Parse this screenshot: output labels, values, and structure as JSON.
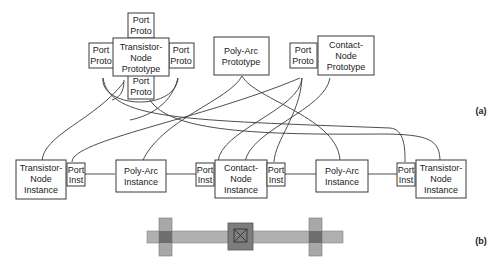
{
  "panel_a": {
    "label": "(a)",
    "prototypes": {
      "transistor": {
        "line1": "Transistor-",
        "line2": "Node",
        "line3": "Prototype"
      },
      "poly_arc": {
        "line1": "Poly-Arc",
        "line2": "Prototype"
      },
      "contact": {
        "line1": "Contact-",
        "line2": "Node",
        "line3": "Prototype"
      },
      "port_proto": {
        "line1": "Port",
        "line2": "Proto"
      }
    },
    "instances": {
      "transistor": {
        "line1": "Transistor-",
        "line2": "Node",
        "line3": "Instance"
      },
      "poly_arc": {
        "line1": "Poly-Arc",
        "line2": "Instance"
      },
      "contact": {
        "line1": "Contact-",
        "line2": "Node",
        "line3": "Instance"
      },
      "port_inst": {
        "line1": "Port",
        "line2": "Inst"
      }
    }
  },
  "panel_b": {
    "label": "(b)",
    "colors": {
      "poly": "#a9a9a9",
      "transistor_gate": "#a0a0a0",
      "overlap": "#6e6e6e",
      "contact": "#7d7d7d",
      "contact_cut": "#555555"
    }
  }
}
